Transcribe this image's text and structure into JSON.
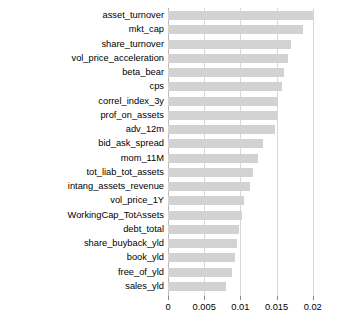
{
  "chart_data": {
    "type": "bar",
    "orientation": "horizontal",
    "title": "",
    "xlabel": "",
    "ylabel": "",
    "xlim": [
      0,
      0.021
    ],
    "xticks": [
      0,
      0.005,
      0.01,
      0.015,
      0.02
    ],
    "xtick_labels": [
      "0",
      "0.005",
      "0.01",
      "0.015",
      "0.02"
    ],
    "grid": true,
    "legend": false,
    "bar_color": "#d2d2d2",
    "categories": [
      "asset_turnover",
      "mkt_cap",
      "share_turnover",
      "vol_price_acceleration",
      "beta_bear",
      "cps",
      "correl_index_3y",
      "prof_on_assets",
      "adv_12m",
      "bid_ask_spread",
      "mom_11M",
      "tot_liab_tot_assets",
      "intang_assets_revenue",
      "vol_price_1Y",
      "WorkingCap_TotAssets",
      "debt_total",
      "share_buyback_yld",
      "book_yld",
      "free_of_yld",
      "sales_yld"
    ],
    "values": [
      0.02,
      0.0187,
      0.017,
      0.0166,
      0.016,
      0.0158,
      0.0152,
      0.015,
      0.0148,
      0.0131,
      0.0125,
      0.0118,
      0.0113,
      0.0105,
      0.0102,
      0.0098,
      0.0095,
      0.0092,
      0.0088,
      0.008
    ]
  }
}
